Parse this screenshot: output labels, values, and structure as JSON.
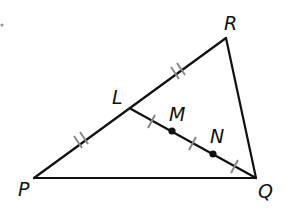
{
  "diagram": {
    "type": "triangle",
    "points": {
      "P": {
        "label": "P",
        "x": 34,
        "y": 178
      },
      "Q": {
        "label": "Q",
        "x": 256,
        "y": 178
      },
      "R": {
        "label": "R",
        "x": 226,
        "y": 38
      },
      "L": {
        "label": "L",
        "x": 131,
        "y": 109
      },
      "M": {
        "label": "M",
        "x": 172,
        "y": 131
      },
      "N": {
        "label": "N",
        "x": 213,
        "y": 154
      }
    },
    "segments": [
      "PQ",
      "QR",
      "RP",
      "LQ"
    ],
    "marks": {
      "double_ticks": [
        "PL",
        "LR"
      ],
      "single_ticks": [
        "LM",
        "MN",
        "NQ"
      ]
    },
    "colors": {
      "line": "#111111",
      "tick": "#888888"
    }
  }
}
